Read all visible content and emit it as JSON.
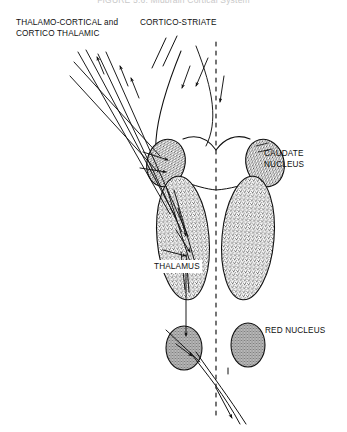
{
  "figure": {
    "title": "FIGURE 5.6: Midbrain Cortical System",
    "background_color": "#ffffff",
    "ink_color": "#101010",
    "width": 347,
    "height": 432
  },
  "labels": {
    "thalamo_cortical_line1": "THALAMO-CORTICAL and",
    "thalamo_cortical_line2": "CORTICO THALAMIC",
    "cortico_striate": "CORTICO-STRIATE",
    "caudate_line1": "CAUDATE",
    "caudate_line2": "NUCLEUS",
    "thalamus": "THALAMUS",
    "red_nucleus": "RED NUCLEUS"
  },
  "structures": [
    {
      "name": "caudate-nucleus-left",
      "shape": "stippled-oval",
      "cx": 166,
      "cy": 163,
      "rx": 19,
      "ry": 24
    },
    {
      "name": "caudate-nucleus-right",
      "shape": "stippled-oval",
      "cx": 265,
      "cy": 163,
      "rx": 19,
      "ry": 24
    },
    {
      "name": "thalamus-left",
      "shape": "stippled-ellipse",
      "cx": 183,
      "cy": 238,
      "rx": 26,
      "ry": 62
    },
    {
      "name": "thalamus-right",
      "shape": "stippled-ellipse",
      "cx": 248,
      "cy": 238,
      "rx": 26,
      "ry": 62
    },
    {
      "name": "red-nucleus-left",
      "shape": "stippled-oval",
      "cx": 184,
      "cy": 348,
      "rx": 18,
      "ry": 22
    },
    {
      "name": "red-nucleus-right",
      "shape": "stippled-oval",
      "cx": 248,
      "cy": 345,
      "rx": 17,
      "ry": 22
    },
    {
      "name": "midline",
      "shape": "dashed-vertical",
      "x": 216,
      "y1": 42,
      "y2": 420
    },
    {
      "name": "ventricle-outline",
      "shape": "curve"
    }
  ],
  "tracts": [
    {
      "name": "thalamo-cortical-tract",
      "direction": "ascending",
      "arrowheads": 3
    },
    {
      "name": "cortico-thalamic-tract",
      "direction": "descending",
      "arrowheads": 2
    },
    {
      "name": "cortico-striate-tract",
      "direction": "descending",
      "arrowheads": 2
    },
    {
      "name": "rubrospinal-tract",
      "direction": "descending-crossing",
      "arrowheads": 1
    }
  ]
}
